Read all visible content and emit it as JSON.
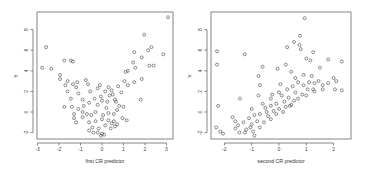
{
  "chart_data": [
    {
      "type": "scatter",
      "title": "",
      "xlabel": "first CR predictor",
      "ylabel": "Y",
      "xlim": [
        -3,
        3.2
      ],
      "ylim": [
        -2.6,
        10
      ],
      "xticks": [
        "-3",
        "-2",
        "-1",
        "0",
        "1",
        "2",
        "3"
      ],
      "yticks": [
        "-2",
        "0",
        "2",
        "4",
        "6",
        "8"
      ],
      "grid": false,
      "legend": null,
      "marker": "open circle",
      "description": "U-shaped (quadratic) relationship: Y lowest near x=0, rising toward both ends",
      "points": [
        [
          3.07,
          9.2
        ],
        [
          1.96,
          7.5
        ],
        [
          -2.6,
          6.3
        ],
        [
          -2.78,
          4.3
        ],
        [
          -2.36,
          4.2
        ],
        [
          -1.75,
          5.0
        ],
        [
          -1.45,
          5.0
        ],
        [
          -1.35,
          4.9
        ],
        [
          2.3,
          6.3
        ],
        [
          2.15,
          6.0
        ],
        [
          1.5,
          5.8
        ],
        [
          2.85,
          5.6
        ],
        [
          1.85,
          5.3
        ],
        [
          1.45,
          4.8
        ],
        [
          2.2,
          4.5
        ],
        [
          2.4,
          4.5
        ],
        [
          1.55,
          4.3
        ],
        [
          1.1,
          3.9
        ],
        [
          1.2,
          4.0
        ],
        [
          1.85,
          3.2
        ],
        [
          1.05,
          3.0
        ],
        [
          1.5,
          2.9
        ],
        [
          1.2,
          2.6
        ],
        [
          1.8,
          1.2
        ],
        [
          -1.95,
          3.6
        ],
        [
          -1.95,
          3.2
        ],
        [
          -1.6,
          3.0
        ],
        [
          -1.15,
          2.9
        ],
        [
          -0.75,
          3.1
        ],
        [
          -1.7,
          2.6
        ],
        [
          -1.35,
          2.7
        ],
        [
          -1.2,
          2.4
        ],
        [
          -0.65,
          2.7
        ],
        [
          -1.6,
          2.0
        ],
        [
          -1.1,
          1.8
        ],
        [
          -1.45,
          1.3
        ],
        [
          -1.75,
          0.5
        ],
        [
          -1.4,
          0.5
        ],
        [
          -0.9,
          1.2
        ],
        [
          -0.55,
          2.0
        ],
        [
          -0.2,
          2.3
        ],
        [
          0.15,
          2.0
        ],
        [
          0.35,
          1.6
        ],
        [
          -0.05,
          1.5
        ],
        [
          0.5,
          1.7
        ],
        [
          0.9,
          1.9
        ],
        [
          0.75,
          2.5
        ],
        [
          0.45,
          2.1
        ],
        [
          -0.35,
          1.3
        ],
        [
          0.0,
          1.1
        ],
        [
          0.25,
          1.0
        ],
        [
          0.6,
          1.2
        ],
        [
          0.8,
          0.6
        ],
        [
          1.0,
          0.5
        ],
        [
          -0.6,
          0.9
        ],
        [
          -0.2,
          0.7
        ],
        [
          -1.1,
          0.3
        ],
        [
          -0.9,
          0.0
        ],
        [
          -0.7,
          -0.2
        ],
        [
          -1.3,
          -0.6
        ],
        [
          -1.2,
          -1.0
        ],
        [
          -0.9,
          -0.5
        ],
        [
          -0.5,
          -0.3
        ],
        [
          -0.3,
          0.0
        ],
        [
          0.05,
          -0.3
        ],
        [
          0.3,
          -0.1
        ],
        [
          0.55,
          -0.2
        ],
        [
          0.7,
          0.2
        ],
        [
          0.95,
          -0.6
        ],
        [
          1.15,
          -0.8
        ],
        [
          -0.6,
          -1.0
        ],
        [
          -0.3,
          -0.9
        ],
        [
          0.0,
          -0.7
        ],
        [
          0.3,
          -0.8
        ],
        [
          0.55,
          -0.9
        ],
        [
          0.7,
          -1.2
        ],
        [
          -0.45,
          -1.5
        ],
        [
          -0.15,
          -1.6
        ],
        [
          0.15,
          -1.3
        ],
        [
          0.4,
          -1.6
        ],
        [
          -0.6,
          -1.8
        ],
        [
          -0.2,
          -2.0
        ],
        [
          0.0,
          -2.1
        ],
        [
          -0.05,
          -2.3
        ],
        [
          0.1,
          -2.2
        ],
        [
          -0.4,
          -2.0
        ],
        [
          0.6,
          -1.4
        ],
        [
          0.45,
          -1.1
        ],
        [
          -1.3,
          -0.2
        ],
        [
          -0.85,
          0.6
        ],
        [
          0.2,
          0.4
        ],
        [
          0.65,
          1.0
        ],
        [
          -0.1,
          2.6
        ],
        [
          0.3,
          2.4
        ]
      ]
    },
    {
      "type": "scatter",
      "title": "",
      "xlabel": "second CR predictor",
      "ylabel": "Y",
      "xlim": [
        -2.45,
        2.65
      ],
      "ylim": [
        -2.6,
        10
      ],
      "xticks": [
        "-2",
        "-1",
        "0",
        "1",
        "2"
      ],
      "yticks": [
        "-2",
        "0",
        "2",
        "4",
        "6",
        "8"
      ],
      "grid": false,
      "legend": null,
      "marker": "open circle",
      "description": "Positive roughly linear relationship with upper scatter of outliers",
      "points": [
        [
          0.94,
          9.1
        ],
        [
          0.77,
          7.4
        ],
        [
          -2.27,
          5.9
        ],
        [
          -1.25,
          5.6
        ],
        [
          -2.27,
          4.6
        ],
        [
          -2.23,
          0.6
        ],
        [
          -1.43,
          1.3
        ],
        [
          0.3,
          6.3
        ],
        [
          0.55,
          6.8
        ],
        [
          0.75,
          6.5
        ],
        [
          0.8,
          6.1
        ],
        [
          1.25,
          5.8
        ],
        [
          1.0,
          5.2
        ],
        [
          1.15,
          5.0
        ],
        [
          1.8,
          5.1
        ],
        [
          2.3,
          4.9
        ],
        [
          0.25,
          4.6
        ],
        [
          -0.05,
          4.2
        ],
        [
          -0.6,
          4.4
        ],
        [
          0.45,
          3.9
        ],
        [
          1.5,
          4.3
        ],
        [
          0.9,
          3.6
        ],
        [
          2.0,
          3.3
        ],
        [
          -0.75,
          3.5
        ],
        [
          -0.7,
          2.6
        ],
        [
          -0.75,
          1.6
        ],
        [
          -1.0,
          0.3
        ],
        [
          -0.3,
          1.3
        ],
        [
          2.3,
          2.1
        ],
        [
          2.05,
          2.2
        ],
        [
          1.6,
          2.2
        ],
        [
          0.0,
          1.9
        ],
        [
          0.3,
          2.2
        ],
        [
          0.5,
          2.5
        ],
        [
          0.7,
          2.9
        ],
        [
          0.9,
          2.6
        ],
        [
          1.1,
          2.9
        ],
        [
          1.3,
          2.8
        ],
        [
          1.45,
          3.0
        ],
        [
          0.1,
          1.6
        ],
        [
          0.35,
          1.4
        ],
        [
          0.6,
          1.9
        ],
        [
          0.85,
          1.7
        ],
        [
          1.05,
          2.2
        ],
        [
          1.25,
          2.2
        ],
        [
          0.55,
          1.1
        ],
        [
          0.2,
          1.0
        ],
        [
          -0.1,
          0.8
        ],
        [
          -0.3,
          0.6
        ],
        [
          -0.5,
          0.4
        ],
        [
          0.0,
          0.3
        ],
        [
          0.25,
          0.5
        ],
        [
          0.45,
          0.7
        ],
        [
          -0.7,
          -0.2
        ],
        [
          -0.45,
          0.0
        ],
        [
          -0.2,
          0.1
        ],
        [
          -0.9,
          -0.3
        ],
        [
          -1.1,
          -0.6
        ],
        [
          -0.8,
          -0.9
        ],
        [
          -0.55,
          -1.0
        ],
        [
          -0.3,
          -0.7
        ],
        [
          -1.3,
          -1.0
        ],
        [
          -1.0,
          -1.2
        ],
        [
          -1.5,
          -1.3
        ],
        [
          -1.6,
          -0.9
        ],
        [
          -1.2,
          -1.7
        ],
        [
          -0.95,
          -1.9
        ],
        [
          -0.7,
          -1.5
        ],
        [
          -1.45,
          -2.0
        ],
        [
          -1.6,
          -1.6
        ],
        [
          -0.9,
          -2.3
        ],
        [
          -2.3,
          -1.5
        ],
        [
          -2.15,
          -1.9
        ],
        [
          -2.05,
          -2.1
        ],
        [
          -1.25,
          -2.0
        ],
        [
          -1.05,
          -1.5
        ],
        [
          -0.4,
          -0.4
        ],
        [
          -0.1,
          -0.2
        ],
        [
          0.15,
          0.0
        ],
        [
          0.4,
          0.6
        ],
        [
          0.7,
          1.3
        ],
        [
          1.0,
          1.6
        ],
        [
          1.3,
          2.0
        ],
        [
          1.6,
          2.6
        ],
        [
          1.8,
          2.8
        ],
        [
          2.1,
          3.0
        ],
        [
          -0.6,
          0.8
        ],
        [
          -0.25,
          1.7
        ],
        [
          0.05,
          2.7
        ],
        [
          0.6,
          3.3
        ],
        [
          1.2,
          3.5
        ],
        [
          -1.7,
          -0.5
        ]
      ]
    }
  ],
  "panels": [
    {
      "xlabel": "first CR predictor",
      "ylabel": "Y",
      "xticks": [
        "-3",
        "-2",
        "-1",
        "0",
        "1",
        "2",
        "3"
      ],
      "yticks": [
        "-2",
        "0",
        "2",
        "4",
        "6",
        "8"
      ]
    },
    {
      "xlabel": "second CR predictor",
      "ylabel": "Y",
      "xticks": [
        "-2",
        "-1",
        "0",
        "1",
        "2"
      ],
      "yticks": [
        "-2",
        "0",
        "2",
        "4",
        "6",
        "8"
      ]
    }
  ]
}
